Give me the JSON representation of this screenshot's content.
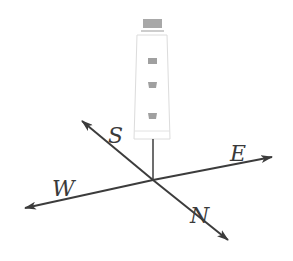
{
  "diagram": {
    "directions": {
      "north": "N",
      "south": "S",
      "east": "E",
      "west": "W"
    },
    "colors": {
      "line": "#3c3c3c",
      "lighthouse_outline": "#d8d8d8",
      "window": "#9a9a9a"
    }
  }
}
